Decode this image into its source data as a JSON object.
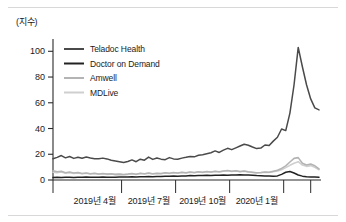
{
  "figure": {
    "unit_label": "(지수)",
    "top_rule_color": "#d8d8d8",
    "background": "#ffffff"
  },
  "chart_data": {
    "type": "line",
    "title": "",
    "subtitle": "",
    "xlabel": "",
    "ylabel": "(지수)",
    "ylim": [
      0,
      108
    ],
    "yticks": [
      0,
      20,
      40,
      60,
      80,
      100
    ],
    "ytick_labels": [
      "0",
      "20",
      "40",
      "60",
      "80",
      "100"
    ],
    "grid": false,
    "legend_position": "upper-left-inside",
    "x_tick_labels": [
      "2019년 4월",
      "2019년 7월",
      "2019년 10월",
      "2020년 1월"
    ],
    "x_tick_positions": [
      10,
      23,
      36,
      49
    ],
    "x_index_range": [
      0,
      62
    ],
    "series": [
      {
        "name": "Teladoc Health",
        "color": "#4a4a4a",
        "width": 1.5,
        "values": [
          16.5,
          17.6,
          19.0,
          17.2,
          18.3,
          16.8,
          17.6,
          16.9,
          17.8,
          17.1,
          16.6,
          16.6,
          17.0,
          16.4,
          15.4,
          14.8,
          14.2,
          13.6,
          14.4,
          15.6,
          14.2,
          16.2,
          15.4,
          17.8,
          16.0,
          17.1,
          16.2,
          15.8,
          17.4,
          16.4,
          16.1,
          17.0,
          17.6,
          18.3,
          18.0,
          19.2,
          19.6,
          20.4,
          21.2,
          22.6,
          21.4,
          23.2,
          24.6,
          23.6,
          25.0,
          26.4,
          27.8,
          27.0,
          25.6,
          24.4,
          24.8,
          27.2,
          26.8,
          30.2,
          33.2,
          39.6,
          38.4,
          52.0,
          74.0,
          103.0,
          88.0,
          74.0,
          63.0,
          56.0,
          54.5
        ]
      },
      {
        "name": "Doctor on Demand",
        "color": "#222222",
        "width": 1.5,
        "values": [
          2.0,
          2.1,
          2.0,
          2.2,
          2.1,
          2.0,
          2.2,
          2.1,
          2.3,
          2.2,
          2.1,
          2.2,
          2.3,
          2.2,
          2.1,
          2.2,
          2.3,
          2.4,
          2.3,
          2.5,
          2.4,
          2.6,
          2.5,
          2.7,
          2.6,
          2.8,
          2.7,
          3.0,
          2.9,
          3.1,
          3.0,
          3.2,
          3.1,
          3.4,
          3.3,
          3.5,
          3.4,
          3.6,
          3.5,
          3.7,
          3.6,
          3.8,
          3.7,
          3.9,
          3.8,
          4.0,
          3.9,
          3.8,
          3.6,
          3.4,
          3.3,
          3.2,
          3.1,
          3.0,
          3.2,
          4.4,
          6.0,
          6.6,
          5.4,
          3.9,
          3.0,
          2.6,
          2.4,
          2.3,
          2.2
        ]
      },
      {
        "name": "Amwell",
        "color": "#b4b4b4",
        "width": 1.6,
        "values": [
          7.2,
          6.4,
          6.8,
          5.6,
          6.2,
          5.4,
          5.8,
          5.0,
          5.4,
          4.8,
          5.2,
          4.6,
          5.0,
          4.6,
          4.8,
          4.4,
          4.6,
          4.3,
          4.6,
          5.0,
          4.5,
          5.2,
          4.8,
          5.4,
          4.9,
          5.3,
          5.0,
          5.6,
          5.2,
          5.8,
          5.4,
          6.0,
          5.6,
          6.2,
          5.8,
          6.4,
          6.0,
          6.6,
          6.2,
          6.8,
          6.4,
          7.0,
          7.4,
          6.8,
          7.2,
          6.6,
          7.0,
          6.4,
          6.0,
          5.6,
          5.8,
          6.2,
          6.0,
          6.8,
          7.6,
          9.0,
          11.0,
          14.0,
          16.8,
          17.4,
          13.0,
          11.6,
          12.4,
          11.0,
          8.6
        ]
      },
      {
        "name": "MDLive",
        "color": "#cfcfcf",
        "width": 1.6,
        "values": [
          6.0,
          5.6,
          6.2,
          5.2,
          5.6,
          5.0,
          5.4,
          4.8,
          5.2,
          4.6,
          5.0,
          4.5,
          4.8,
          4.4,
          4.6,
          4.2,
          4.4,
          4.1,
          4.4,
          4.8,
          4.3,
          5.0,
          4.6,
          5.2,
          4.7,
          5.1,
          4.8,
          5.4,
          5.0,
          5.6,
          5.2,
          5.8,
          5.4,
          6.0,
          5.6,
          6.2,
          5.8,
          6.4,
          6.0,
          6.6,
          6.2,
          6.8,
          7.2,
          6.6,
          7.0,
          6.4,
          6.8,
          6.2,
          5.8,
          5.4,
          5.6,
          6.0,
          5.8,
          6.4,
          7.0,
          8.0,
          9.6,
          11.4,
          13.0,
          14.2,
          11.6,
          10.6,
          11.2,
          9.8,
          8.0
        ]
      }
    ]
  },
  "legend": {
    "items": [
      {
        "label": "Teladoc Health",
        "color": "#4a4a4a"
      },
      {
        "label": "Doctor on Demand",
        "color": "#222222"
      },
      {
        "label": "Amwell",
        "color": "#b4b4b4"
      },
      {
        "label": "MDLive",
        "color": "#cfcfcf"
      }
    ]
  }
}
